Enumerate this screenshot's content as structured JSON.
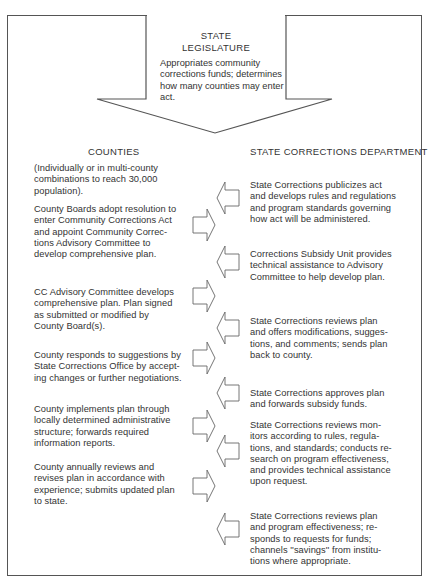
{
  "diagram": {
    "colors": {
      "line": "#555555",
      "text": "#333333",
      "background": "#ffffff"
    },
    "legislature": {
      "title_line1": "STATE",
      "title_line2": "LEGISLATURE",
      "description": "Appropriates community corrections funds; determines how many counties may enter act."
    },
    "columns": {
      "left_header": "COUNTIES",
      "right_header": "STATE CORRECTIONS DEPARTMENT"
    },
    "counties": [
      {
        "id": "c0",
        "lines": [
          "(Individually or in multi-county",
          "combinations to reach 30,000",
          "population)."
        ]
      },
      {
        "id": "c1",
        "lines": [
          "County Boards adopt resolution to",
          "enter Community Corrections Act",
          "and appoint Community Correc-",
          "tions Advisory Committee to",
          "develop comprehensive plan."
        ]
      },
      {
        "id": "c2",
        "lines": [
          "CC Advisory Committee develops",
          "comprehensive plan. Plan signed",
          "as submitted or modified by",
          "County Board(s)."
        ]
      },
      {
        "id": "c3",
        "lines": [
          "County responds to suggestions by",
          "State Corrections Office by accept-",
          "ing changes or further negotiations."
        ]
      },
      {
        "id": "c4",
        "lines": [
          "County implements plan through",
          "locally determined administrative",
          "structure; forwards required",
          "information reports."
        ]
      },
      {
        "id": "c5",
        "lines": [
          "County annually reviews and",
          "revises plan in accordance with",
          "experience; submits updated plan",
          "to state."
        ]
      }
    ],
    "state_corrections": [
      {
        "id": "s0",
        "lines": [
          "State Corrections publicizes act",
          "and develops rules and regulations",
          "and program standards governing",
          "how act will be administered."
        ]
      },
      {
        "id": "s1",
        "lines": [
          "Corrections Subsidy Unit provides",
          "technical assistance to Advisory",
          "Committee to help develop plan."
        ]
      },
      {
        "id": "s2",
        "lines": [
          "State Corrections reviews plan",
          "and offers modifications, sugges-",
          "tions, and comments; sends plan",
          "back to county."
        ]
      },
      {
        "id": "s3",
        "lines": [
          "State Corrections approves plan",
          "and forwards subsidy funds."
        ]
      },
      {
        "id": "s4",
        "lines": [
          "State Corrections reviews mon-",
          "itors according to rules, regula-",
          "tions, and standards; conducts re-",
          "search on program effectiveness,",
          "and provides technical assistance",
          "upon request."
        ]
      },
      {
        "id": "s5",
        "lines": [
          "State Corrections reviews plan",
          "and program effectiveness; re-",
          "sponds to requests for funds;",
          "channels ''savings'' from institu-",
          "tions where appropriate."
        ]
      }
    ],
    "arrows": {
      "legislature_down": "down-arrow",
      "to_state": [
        "right-arrow",
        "right-arrow",
        "right-arrow",
        "right-arrow",
        "right-arrow"
      ],
      "to_county": [
        "left-arrow",
        "left-arrow",
        "left-arrow",
        "left-arrow",
        "left-arrow",
        "left-arrow"
      ]
    }
  }
}
